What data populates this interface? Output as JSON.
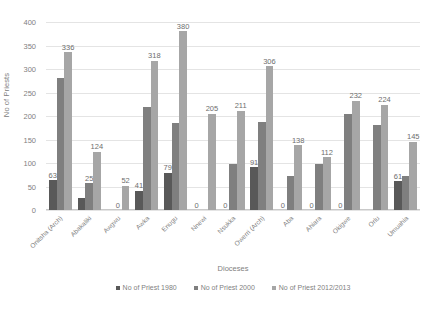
{
  "chart_data": {
    "type": "bar",
    "title": "",
    "xlabel": "Dioceses",
    "ylabel": "No of Priests",
    "ylim": [
      0,
      400
    ],
    "yticks": [
      0,
      50,
      100,
      150,
      200,
      250,
      300,
      350,
      400
    ],
    "grid": true,
    "legend_position": "bottom",
    "categories": [
      "Onitsha (Arch)",
      "Abakaliki",
      "Awgwu",
      "Awka",
      "Enugu",
      "Nnewi",
      "Nsukka",
      "Owerri (Arch)",
      "Aba",
      "Ahiara",
      "Okigwe",
      "Orlu",
      "Umuahia"
    ],
    "series": [
      {
        "name": "No of Priest 1980",
        "color": "#595959",
        "values": [
          63,
          25,
          0,
          41,
          79,
          0,
          0,
          91,
          0,
          0,
          0,
          0,
          61
        ]
      },
      {
        "name": "No of Priest 2000",
        "color": "#7f7f7f",
        "values": [
          280,
          57,
          0,
          220,
          185,
          0,
          97,
          188,
          72,
          97,
          205,
          180,
          72
        ]
      },
      {
        "name": "No of Priest 2012/2013",
        "color": "#a6a6a6",
        "values": [
          336,
          124,
          52,
          318,
          380,
          205,
          211,
          306,
          138,
          112,
          232,
          224,
          145
        ]
      }
    ],
    "data_labels": [
      [
        "63",
        "",
        "",
        "41",
        "79",
        "0",
        "0",
        "91",
        "0",
        "0",
        "0",
        "",
        "61"
      ],
      [
        "",
        "25",
        "0",
        "",
        "",
        "",
        "",
        "",
        "",
        "",
        "",
        "",
        ""
      ],
      [
        "336",
        "124",
        "52",
        "318",
        "380",
        "205",
        "211",
        "306",
        "138",
        "112",
        "232",
        "224",
        "145"
      ]
    ]
  },
  "legend": {
    "items": [
      {
        "label": "No of Priest 1980",
        "color": "#595959"
      },
      {
        "label": "No of Priest 2000",
        "color": "#7f7f7f"
      },
      {
        "label": "No of Priest 2012/2013",
        "color": "#a6a6a6"
      }
    ]
  }
}
